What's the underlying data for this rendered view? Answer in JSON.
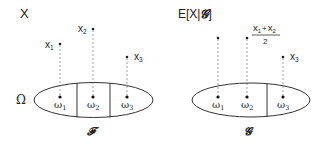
{
  "left_panel": {
    "title": "X",
    "space_label": "Ω",
    "sigma_algebra_label": "𝓕",
    "partition_cells": 3,
    "outcomes": [
      {
        "label": "ω",
        "sub": "1",
        "value_label": "x",
        "value_sub": "1",
        "height": "mid"
      },
      {
        "label": "ω",
        "sub": "2",
        "value_label": "x",
        "value_sub": "2",
        "height": "high"
      },
      {
        "label": "ω",
        "sub": "3",
        "value_label": "x",
        "value_sub": "3",
        "height": "low"
      }
    ]
  },
  "right_panel": {
    "title_prefix": "E[X|",
    "title_script": "𝓖",
    "title_suffix": "]",
    "sigma_algebra_label": "𝓖",
    "partition_cells": 2,
    "fraction": {
      "numerator_a": "x",
      "numerator_a_sub": "1",
      "plus": "+",
      "numerator_b": "x",
      "numerator_b_sub": "2",
      "denominator": "2"
    },
    "outcomes": [
      {
        "label": "ω",
        "sub": "1"
      },
      {
        "label": "ω",
        "sub": "2"
      },
      {
        "label": "ω",
        "sub": "3",
        "value_label": "x",
        "value_sub": "3"
      }
    ]
  },
  "colors": {
    "ink": "#222222",
    "dash": "#888888",
    "background": "#ffffff"
  }
}
